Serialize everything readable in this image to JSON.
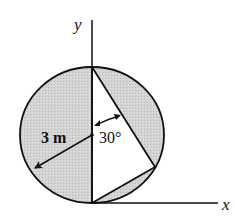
{
  "diagram": {
    "axes": {
      "x_label": "x",
      "y_label": "y"
    },
    "radius_label": "3 m",
    "angle_label": "30°",
    "colors": {
      "line": "#111111",
      "shade": "#cfcfcf",
      "background": "#ffffff"
    },
    "shapes": {
      "circle": {
        "cx": 92,
        "cy": 135,
        "rx": 72,
        "ry": 68,
        "shaded": true
      },
      "triangle": {
        "vertices": [
          [
            92,
            67
          ],
          [
            155,
            167
          ],
          [
            92,
            203
          ]
        ],
        "shaded": false
      },
      "radius_arrow": {
        "from": [
          92,
          135
        ],
        "to": [
          34,
          169
        ]
      }
    }
  }
}
